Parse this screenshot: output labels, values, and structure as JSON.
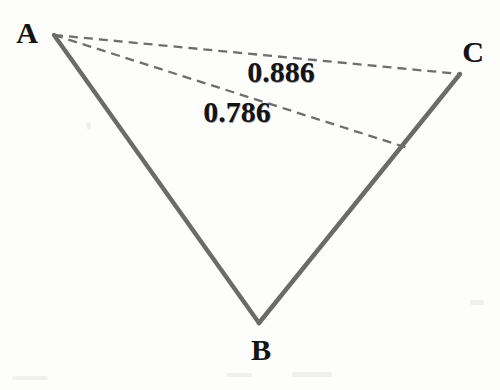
{
  "figure": {
    "type": "geometric-diagram",
    "background_color": "#fdfdfc",
    "solid_line_color": "#6b6b6b",
    "dashed_line_color": "#6e6e6e",
    "label_color": "#141414",
    "width": 500,
    "height": 390,
    "vertices": [
      {
        "name": "A",
        "label": "A",
        "x": 54,
        "y": 35,
        "label_x": 27,
        "label_y": 33
      },
      {
        "name": "B",
        "label": "B",
        "x": 259,
        "y": 323,
        "label_x": 261,
        "label_y": 350
      },
      {
        "name": "C",
        "label": "C",
        "x": 460,
        "y": 74,
        "label_x": 473,
        "label_y": 52
      }
    ],
    "solid_edges": [
      {
        "name": "edge-AB",
        "from": "A",
        "to": "B",
        "x1": 54,
        "y1": 35,
        "x2": 259,
        "y2": 323
      },
      {
        "name": "edge-BC",
        "from": "B",
        "to": "C",
        "x1": 259,
        "y1": 323,
        "x2": 460,
        "y2": 74
      }
    ],
    "dashed_segments": [
      {
        "name": "segment-AC",
        "label": "0.886",
        "x1": 54,
        "y1": 35,
        "x2": 460,
        "y2": 74,
        "label_x": 281,
        "label_y": 72
      },
      {
        "name": "segment-A-to-BC",
        "label": "0.786",
        "x1": 54,
        "y1": 35,
        "x2": 408,
        "y2": 148,
        "label_x": 237,
        "label_y": 112
      }
    ]
  },
  "chart_data": {
    "type": "diagram",
    "title": "",
    "points": {
      "A": [
        54,
        35
      ],
      "B": [
        259,
        323
      ],
      "C": [
        460,
        74
      ]
    },
    "measurements": [
      {
        "from": "A",
        "to": "C",
        "value": 0.886,
        "display": "0.886",
        "style": "dashed"
      },
      {
        "from": "A",
        "to": "BC",
        "value": 0.786,
        "display": "0.786",
        "style": "dashed"
      }
    ],
    "labels": [
      "A",
      "B",
      "C",
      "0.886",
      "0.786"
    ]
  }
}
